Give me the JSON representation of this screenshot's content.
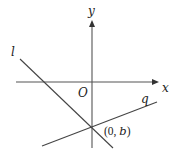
{
  "diagram": {
    "axes": {
      "x_label": "x",
      "y_label": "y",
      "origin_label": "O"
    },
    "lines": [
      {
        "id": "l",
        "label": "l",
        "slope_sign": "negative",
        "passes_through": "(0, b)"
      },
      {
        "id": "q",
        "label": "q",
        "slope_sign": "positive",
        "passes_through": "(0, b)"
      }
    ],
    "intersection": {
      "label_prefix": "(0, ",
      "label_var": "b",
      "label_suffix": ")"
    },
    "colors": {
      "stroke": "#444444",
      "text": "#222222"
    }
  }
}
